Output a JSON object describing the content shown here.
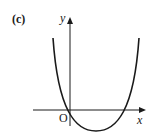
{
  "figure": {
    "part_label": "(c)",
    "axes": {
      "x_label": "x",
      "y_label": "y",
      "origin_label": "O"
    },
    "curve": {
      "type": "parabola",
      "description": "Upward-opening parabola passing through the origin, crossing the x-axis again at a positive x-value, with its minimum below the x-axis between the two roots",
      "color": "#1a1a1a"
    }
  }
}
